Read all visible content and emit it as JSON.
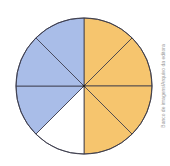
{
  "diagram": {
    "type": "fraction-circle",
    "total_parts": 8,
    "center": [
      84,
      86
    ],
    "radius": 68,
    "slices": [
      {
        "index": 0,
        "fill": "#f6c56e",
        "label": "shaded-yellow"
      },
      {
        "index": 1,
        "fill": "#f6c56e",
        "label": "shaded-yellow"
      },
      {
        "index": 2,
        "fill": "#f6c56e",
        "label": "shaded-yellow"
      },
      {
        "index": 3,
        "fill": "#f6c56e",
        "label": "shaded-yellow"
      },
      {
        "index": 4,
        "fill": "#ffffff",
        "label": "unshaded"
      },
      {
        "index": 5,
        "fill": "#a9bde8",
        "label": "shaded-blue"
      },
      {
        "index": 6,
        "fill": "#a9bde8",
        "label": "shaded-blue"
      },
      {
        "index": 7,
        "fill": "#a9bde8",
        "label": "shaded-blue"
      }
    ],
    "summary": {
      "yellow_parts": 4,
      "blue_parts": 3,
      "white_parts": 1
    },
    "stroke": "#3a3a4a"
  },
  "credit": "Banco de imagens/Arquivo da editora"
}
